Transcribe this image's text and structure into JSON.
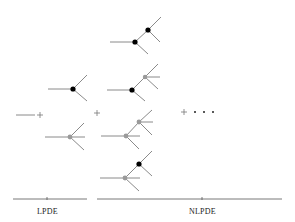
{
  "colors": {
    "line": "#8a8a8a",
    "axis": "#555555",
    "black_node": "#000000",
    "gray_node": "#9a9a9a"
  },
  "diagram": {
    "operators": [
      "+",
      "+",
      "+"
    ],
    "ellipsis": ". . .",
    "groups": [
      {
        "label": "LPDE",
        "trees": [
          "bare-line",
          "black-node-binary",
          "gray-node-ternary"
        ]
      },
      {
        "label": "NLPDE",
        "trees": [
          "black-black-binary",
          "black-gray-ternary",
          "gray-gray-ternary",
          "gray-black-binary"
        ]
      }
    ]
  },
  "labels": {
    "lpde": "LPDE",
    "nlpde": "NLPDE"
  }
}
